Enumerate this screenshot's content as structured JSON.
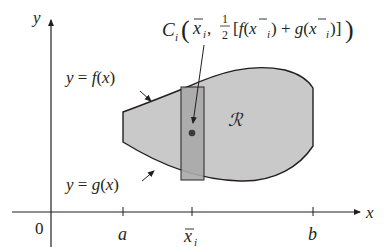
{
  "diagram": {
    "axes": {
      "x_label": "x",
      "y_label": "y",
      "origin_label": "0"
    },
    "ticks": {
      "a": "a",
      "xbar_i": "x",
      "xbar_i_sub": "i",
      "b": "b"
    },
    "curves": {
      "upper": {
        "lhs": "y = ",
        "fn": "f",
        "arg": "(x)"
      },
      "lower": {
        "lhs": "y = ",
        "fn": "g",
        "arg": "(x)"
      }
    },
    "region_label": "ℛ",
    "centroid_label": {
      "C": "C",
      "sub": "i",
      "open": "(",
      "xbar": "x",
      "xsub": "i",
      "comma": ", ",
      "half_num": "1",
      "half_den": "2",
      "body": "[f(x",
      "mid": ") + g(x",
      "end": ")]",
      "close": ")"
    },
    "colors": {
      "region_fill": "#c9c9c9",
      "strip_fill": "#a9a9a9",
      "stroke": "#231f20",
      "point": "#3a3a3a",
      "background": "#ffffff"
    }
  }
}
